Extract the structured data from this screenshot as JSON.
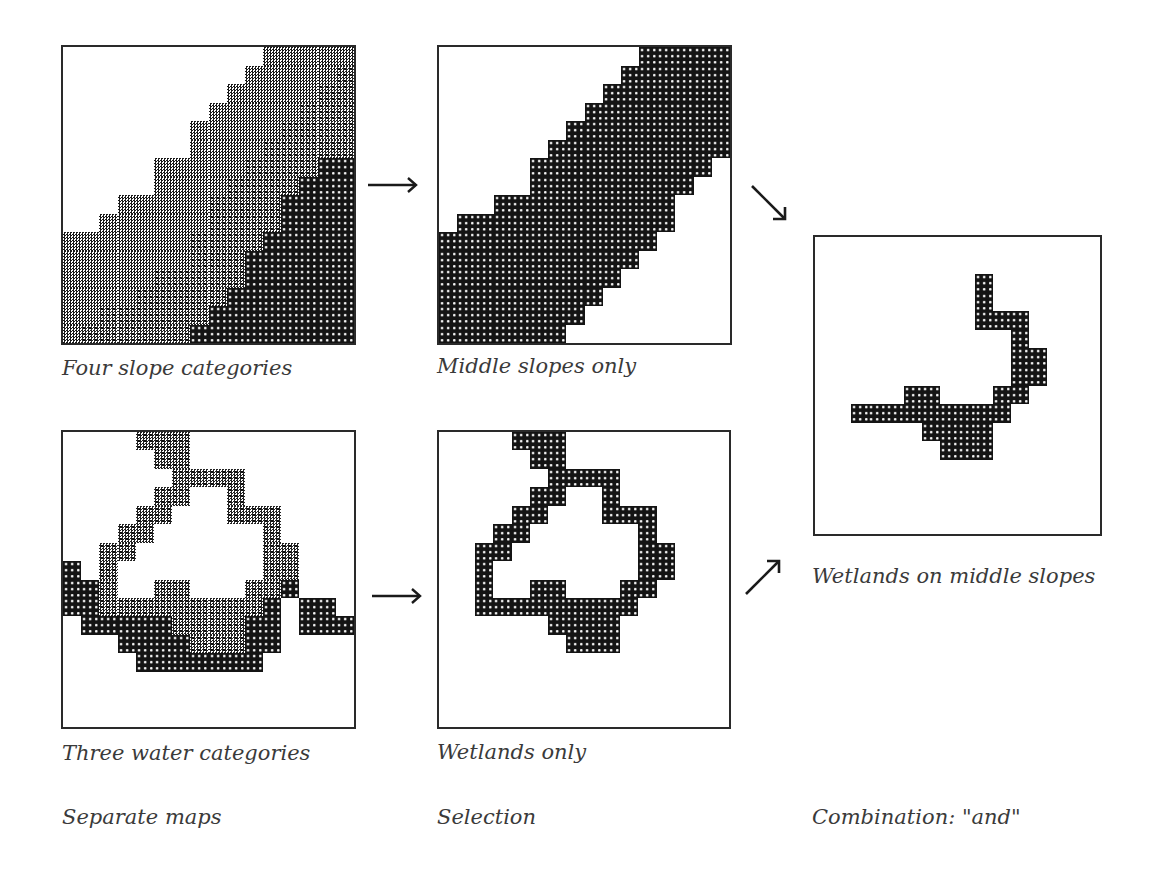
{
  "figure": {
    "maps": [
      {
        "id": "four-slope",
        "caption": "Four slope categories",
        "legend_note": "0 = flat (white), 1 = gentle (checker), 2 = moderate (cross), 3 = steep (dark dots)",
        "grid": [
          "0000000000011111",
          "0000000000111112",
          "0000000001111122",
          "0000000011111222",
          "0000000111112222",
          "0000000111122222",
          "0000011111222233",
          "0000011112222333",
          "0001111122223333",
          "0011111122223333",
          "1111111222233333",
          "1111111222333333",
          "1111122222333333",
          "1111222223333333",
          "1122222233333333",
          "1222222333333333"
        ]
      },
      {
        "id": "middle-slopes",
        "caption": "Middle slopes only",
        "grid": [
          "0000000000033333",
          "0000000000333333",
          "0000000003333333",
          "0000000033333333",
          "0000000333333333",
          "0000003333333333",
          "0000033333333330",
          "0000033333333300",
          "0003333333333000",
          "0333333333333000",
          "3333333333330000",
          "3333333333300000",
          "3333333333000000",
          "3333333330000000",
          "3333333300000000",
          "3333333000000000"
        ]
      },
      {
        "id": "three-water",
        "caption": "Three water categories",
        "grid": [
          "0000222000000000",
          "0000022000000000",
          "0000002222000000",
          "0000022002000000",
          "0000220002220000",
          "0002200000020000",
          "0022000000022000",
          "3020000000022000",
          "3320022000223000",
          "3322222222230330",
          "0333332222330333",
          "0003333222330000",
          "0000333333300000",
          "0000000000000000",
          "0000000000000000",
          "0000000000000000"
        ]
      },
      {
        "id": "wetlands-only",
        "caption": "Wetlands only",
        "grid": [
          "0000333000000000",
          "0000033000000000",
          "0000003333000000",
          "0000033003000000",
          "0000330003330000",
          "0003300000030000",
          "0033000000033000",
          "0030000000033000",
          "0030033000330000",
          "0033333333300000",
          "0000003333000000",
          "0000000333000000",
          "0000000000000000",
          "0000000000000000",
          "0000000000000000",
          "0000000000000000"
        ]
      },
      {
        "id": "wetlands-middle-slopes",
        "caption": "Wetlands on middle slopes",
        "grid": [
          "0000000000000000",
          "0000000000000000",
          "0000000003000000",
          "0000000003000000",
          "0000000003330000",
          "0000000000030000",
          "0000000000033000",
          "0000000000033000",
          "0000033000330000",
          "0033333333300000",
          "0000003333000000",
          "0000000333000000",
          "0000000000000000",
          "0000000000000000",
          "0000000000000000",
          "0000000000000000"
        ]
      }
    ],
    "column_titles": {
      "left": "Separate maps",
      "middle": "Selection",
      "right": "Combination: \"and\""
    },
    "arrows": [
      {
        "id": "slope-to-middle",
        "glyph": "→"
      },
      {
        "id": "water-to-wetlands",
        "glyph": "→"
      },
      {
        "id": "middle-to-combination",
        "glyph": "↘"
      },
      {
        "id": "wetlands-to-combination",
        "glyph": "↗"
      }
    ],
    "colors": {
      "ink": "#141414",
      "border": "#2a2a2a",
      "text": "#3a3a3a",
      "background": "#ffffff"
    }
  }
}
